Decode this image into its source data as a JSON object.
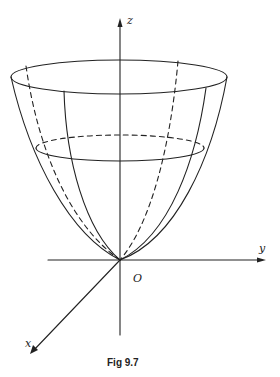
{
  "figure": {
    "caption": "Fig 9.7",
    "axes": {
      "x_label": "x",
      "y_label": "y",
      "z_label": "z",
      "origin_label": "O"
    },
    "colors": {
      "line": "#222222",
      "background": "#ffffff"
    }
  }
}
